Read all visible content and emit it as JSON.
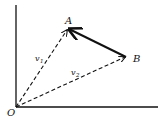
{
  "diagram": {
    "type": "vector-diagram",
    "origin_label": "O",
    "points": [
      {
        "id": "O",
        "label": "O",
        "x": 16,
        "y": 107
      },
      {
        "id": "A",
        "label": "A",
        "x": 68,
        "y": 29
      },
      {
        "id": "B",
        "label": "B",
        "x": 126,
        "y": 57
      }
    ],
    "vectors": [
      {
        "id": "v1",
        "label": "v",
        "subscript": "1",
        "from": "O",
        "to": "A",
        "style": "dashed"
      },
      {
        "id": "v2",
        "label": "v",
        "subscript": "2",
        "from": "O",
        "to": "B",
        "style": "dashed"
      },
      {
        "id": "BA",
        "label": "",
        "from": "B",
        "to": "A",
        "style": "solid"
      }
    ],
    "axes": {
      "x_axis": true,
      "y_axis": true
    },
    "colors": {
      "stroke": "#111111",
      "background": "#ffffff"
    }
  }
}
